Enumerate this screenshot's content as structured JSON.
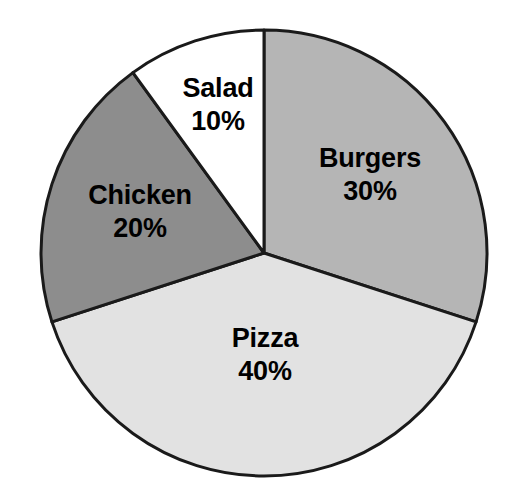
{
  "chart_data": {
    "type": "pie",
    "title": "",
    "subtitle": "",
    "xlabel": "",
    "ylabel": "",
    "legend": "none",
    "grid": false,
    "units": "percent",
    "total": 100,
    "start_angle_deg": 0,
    "direction": "clockwise",
    "categories": [
      "Burgers",
      "Pizza",
      "Chicken",
      "Salad"
    ],
    "values": [
      30,
      40,
      20,
      10
    ],
    "labels": [
      "30%",
      "40%",
      "20%",
      "10%"
    ],
    "colors": [
      "#b5b5b5",
      "#e2e2e2",
      "#8d8d8d",
      "#ffffff"
    ],
    "slices": [
      {
        "name": "Burgers",
        "value": 30,
        "value_label": "30%",
        "color": "#b5b5b5",
        "start_deg": 0,
        "sweep_deg": 108,
        "label_x": 370,
        "label_y": 175
      },
      {
        "name": "Pizza",
        "value": 40,
        "value_label": "40%",
        "color": "#e2e2e2",
        "start_deg": 108,
        "sweep_deg": 144,
        "label_x": 265,
        "label_y": 355
      },
      {
        "name": "Chicken",
        "value": 20,
        "value_label": "20%",
        "color": "#8d8d8d",
        "start_deg": 252,
        "sweep_deg": 72,
        "label_x": 140,
        "label_y": 212
      },
      {
        "name": "Salad",
        "value": 10,
        "value_label": "10%",
        "color": "#ffffff",
        "start_deg": 324,
        "sweep_deg": 36,
        "label_x": 218,
        "label_y": 105
      }
    ],
    "geometry": {
      "center_x": 264,
      "center_y": 253,
      "radius": 223
    },
    "style": {
      "background": "#ffffff",
      "outline": "#1a1a1a",
      "text": "#000000"
    }
  }
}
